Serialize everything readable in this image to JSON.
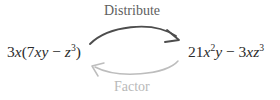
{
  "diagram": {
    "type": "cycle-diagram",
    "background_color": "#ffffff",
    "width": 280,
    "height": 100,
    "nodes": [
      {
        "id": "factored-form",
        "name": "left-expression",
        "text": "3x(7xy − z³)",
        "coefficient": "3",
        "variable": "x",
        "inner_terms": [
          "7xy",
          "− z³"
        ],
        "color": "#2b2b2b"
      },
      {
        "id": "expanded-form",
        "name": "right-expression",
        "text": "21x²y − 3xz³",
        "terms": [
          "21x²y",
          "− 3xz³"
        ],
        "color": "#2b2b2b"
      }
    ],
    "edges": [
      {
        "id": "distribute-arrow",
        "label": "Distribute",
        "direction": "left-to-right",
        "position": "top",
        "color": "#4d4d4d",
        "label_color": "#5e5e5e",
        "stroke_width": 1.9
      },
      {
        "id": "factor-arrow",
        "label": "Factor",
        "direction": "right-to-left",
        "position": "bottom",
        "color": "#bdbdbd",
        "label_color": "#b9b9b9",
        "stroke_width": 1.5
      }
    ]
  },
  "expressions": {
    "left": {
      "coefficient": "3",
      "var1": "x",
      "open_paren": "(",
      "term1_coefficient": "7",
      "term1_var1": "x",
      "term1_var2": "y",
      "operator": " − ",
      "term2_var": "z",
      "term2_exponent": "3",
      "close_paren": ")"
    },
    "right": {
      "term1_coefficient": "21",
      "term1_var1": "x",
      "term1_exponent": "2",
      "term1_var2": "y",
      "operator": " − ",
      "term2_coefficient": "3",
      "term2_var1": "x",
      "term2_var2": "z",
      "term2_exponent": "3"
    }
  },
  "labels": {
    "distribute": "Distribute",
    "factor": "Factor"
  }
}
